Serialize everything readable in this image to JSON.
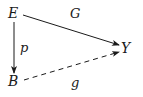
{
  "diagram": {
    "type": "commutative-diagram",
    "nodes": {
      "E": {
        "label": "E"
      },
      "B": {
        "label": "B"
      },
      "Y": {
        "label": "Y"
      }
    },
    "arrows": {
      "p": {
        "label": "p",
        "from": "E",
        "to": "B",
        "style": "solid"
      },
      "G": {
        "label": "G",
        "from": "E",
        "to": "Y",
        "style": "solid"
      },
      "g": {
        "label": "g",
        "from": "B",
        "to": "Y",
        "style": "dashed"
      }
    },
    "colors": {
      "ink": "#1a1a1a",
      "background": "#ffffff"
    }
  }
}
